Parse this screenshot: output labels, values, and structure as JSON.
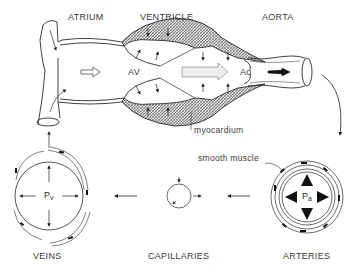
{
  "labels": {
    "atrium": "ATRIUM",
    "ventricle": "VENTRICLE",
    "aorta": "AORTA",
    "veins": "VEINS",
    "capillaries": "CAPILLARIES",
    "arteries": "ARTERIES"
  },
  "annotations": {
    "av": "AV",
    "ao": "Ao",
    "myocardium": "myocardium",
    "smooth_muscle": "smooth muscle",
    "pv": "P",
    "pv_sub": "v",
    "pa": "P",
    "pa_sub": "a"
  },
  "colors": {
    "line": "#2b2b2b",
    "hatch": "#9a9a9a",
    "background": "#ffffff"
  }
}
